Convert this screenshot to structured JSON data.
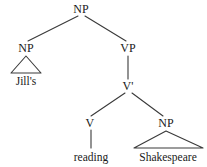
{
  "figure": {
    "kind": "syntax-tree",
    "background_color": "#ffffff",
    "line_color": "#3a3a3a",
    "text_color": "#1a1a1a"
  },
  "nodes": [
    {
      "id": "np-root",
      "label": "NP",
      "x": 81,
      "y": 9
    },
    {
      "id": "np-subject",
      "label": "NP",
      "x": 26,
      "y": 48
    },
    {
      "id": "vp",
      "label": "VP",
      "x": 128,
      "y": 48
    },
    {
      "id": "vbar",
      "label": "V'",
      "x": 128,
      "y": 86
    },
    {
      "id": "v",
      "label": "V",
      "x": 90,
      "y": 123
    },
    {
      "id": "np-object",
      "label": "NP",
      "x": 166,
      "y": 123
    }
  ],
  "terminals": [
    {
      "id": "jills",
      "label": "Jill's",
      "x": 26,
      "y": 81
    },
    {
      "id": "reading",
      "label": "reading",
      "x": 91,
      "y": 157
    },
    {
      "id": "shakespeare",
      "label": "Shakespeare",
      "x": 168,
      "y": 157
    }
  ],
  "edges": [
    {
      "id": "root-to-subject",
      "from": "np-root",
      "to": "np-subject",
      "x1": 78,
      "y1": 16,
      "x2": 28,
      "y2": 41
    },
    {
      "id": "root-to-vp",
      "from": "np-root",
      "to": "vp",
      "x1": 85,
      "y1": 16,
      "x2": 126,
      "y2": 41
    },
    {
      "id": "vp-to-vbar",
      "from": "vp",
      "to": "vbar",
      "x1": 128,
      "y1": 56,
      "x2": 128,
      "y2": 79
    },
    {
      "id": "vbar-to-v",
      "from": "vbar",
      "to": "v",
      "x1": 125,
      "y1": 93,
      "x2": 91,
      "y2": 116
    },
    {
      "id": "vbar-to-np",
      "from": "vbar",
      "to": "np-object",
      "x1": 132,
      "y1": 93,
      "x2": 163,
      "y2": 116
    },
    {
      "id": "v-to-reading",
      "from": "v",
      "to": "reading",
      "x1": 91,
      "y1": 130,
      "x2": 91,
      "y2": 148
    }
  ],
  "triangles": [
    {
      "id": "subject-triangle",
      "node": "np-subject",
      "apex_x": 26,
      "apex_y": 56,
      "left_x": 11,
      "right_x": 41,
      "base_y": 73
    },
    {
      "id": "object-triangle",
      "node": "np-object",
      "apex_x": 166,
      "apex_y": 131,
      "left_x": 134,
      "right_x": 203,
      "base_y": 148
    }
  ]
}
